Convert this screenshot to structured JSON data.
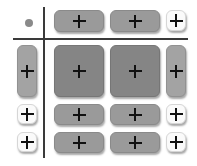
{
  "grid": {
    "corner_icon": "dot",
    "add_icon": "plus",
    "colors": {
      "axis_line": "#3a3a3a",
      "dot": "#8a8a8a",
      "column_header": "#9a9a9a",
      "content_cell": "#858585",
      "row_header_expanded": "#a3a3a3",
      "collapsed": "#fafafa",
      "plus": "#111111"
    },
    "columns": [
      "expanded",
      "expanded",
      "collapsed"
    ],
    "rows": [
      "expanded",
      "collapsed",
      "collapsed"
    ]
  }
}
